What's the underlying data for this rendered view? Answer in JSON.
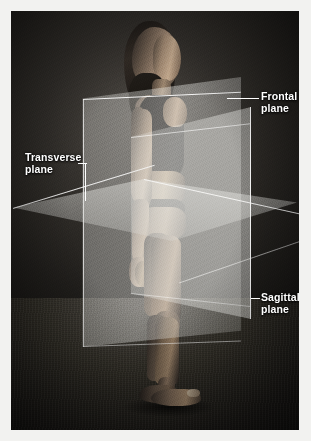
{
  "image": {
    "title": "Anatomical planes of the human body",
    "subject": "standing female figure in anterior-left lateral view",
    "style": "black-and-white photograph with translucent overlay planes",
    "frame": {
      "width_px": 311,
      "height_px": 441,
      "border_color": "#f2f2f0"
    }
  },
  "labels": [
    {
      "id": "frontal",
      "line1": "Frontal",
      "line2": "plane",
      "full_text": "Frontal plane",
      "leader": "horizontal-line",
      "position": "upper-right"
    },
    {
      "id": "transverse",
      "line1": "Transverse",
      "line2": "plane",
      "full_text": "Transverse plane",
      "leader": "elbow-line",
      "position": "mid-left"
    },
    {
      "id": "sagittal",
      "line1": "Sagittal",
      "line2": "plane",
      "full_text": "Sagittal plane",
      "leader": "short-dash",
      "position": "lower-right"
    }
  ],
  "planes": [
    {
      "name": "frontal",
      "alias": "coronal",
      "orientation": "vertical",
      "divides": "anterior and posterior",
      "fill_color": "#e8e8e4",
      "edge_color": "#ffffff"
    },
    {
      "name": "sagittal",
      "alias": "median",
      "orientation": "vertical",
      "divides": "left and right",
      "fill_color": "#f4f4f0",
      "edge_color": "#ffffff"
    },
    {
      "name": "transverse",
      "alias": "horizontal",
      "orientation": "horizontal",
      "divides": "superior and inferior",
      "fill_color": "#ececE8",
      "edge_color": "#ffffff"
    }
  ],
  "colors": {
    "label_text": "#ffffff",
    "leader_line": "#ffffff",
    "photo_background": "#1a1917",
    "page_margin": "#f2f2f0"
  }
}
